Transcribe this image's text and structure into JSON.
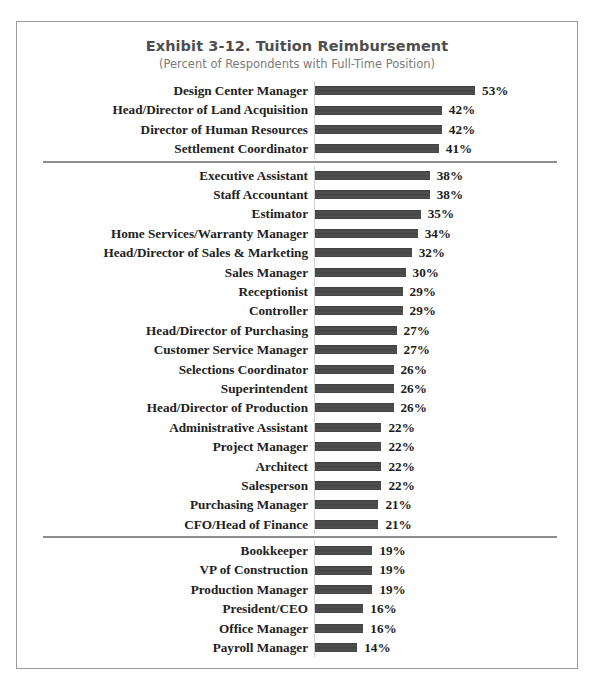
{
  "chart_data": {
    "type": "bar",
    "orientation": "horizontal",
    "title": "Exhibit 3-12.  Tuition Reimbursement",
    "subtitle": "(Percent of Respondents with Full-Time Position)",
    "xlabel": "",
    "ylabel": "",
    "value_suffix": "%",
    "xlim": [
      0,
      53
    ],
    "grid": false,
    "legend": null,
    "bar_color": "#4a4a4a",
    "divider_color": "#8e8e8e",
    "frame_color": "#9a9a9a",
    "title_color": "#4e4e4e",
    "subtitle_color": "#7b7b7b",
    "categories": [
      "Design Center Manager",
      "Head/Director of Land Acquisition",
      "Director of Human Resources",
      "Settlement Coordinator",
      "Executive Assistant",
      "Staff Accountant",
      "Estimator",
      "Home Services/Warranty Manager",
      "Head/Director of Sales & Marketing",
      "Sales Manager",
      "Receptionist",
      "Controller",
      "Head/Director of Purchasing",
      "Customer Service Manager",
      "Selections Coordinator",
      "Superintendent",
      "Head/Director of Production",
      "Administrative Assistant",
      "Project Manager",
      "Architect",
      "Salesperson",
      "Purchasing Manager",
      "CFO/Head of Finance",
      "Bookkeeper",
      "VP of Construction",
      "Production Manager",
      "President/CEO",
      "Office Manager",
      "Payroll Manager"
    ],
    "values": [
      53,
      42,
      42,
      41,
      38,
      38,
      35,
      34,
      32,
      30,
      29,
      29,
      27,
      27,
      26,
      26,
      26,
      22,
      22,
      22,
      22,
      21,
      21,
      19,
      19,
      19,
      16,
      16,
      14
    ],
    "value_labels": [
      "53%",
      "42%",
      "42%",
      "41%",
      "38%",
      "38%",
      "35%",
      "34%",
      "32%",
      "30%",
      "29%",
      "29%",
      "27%",
      "27%",
      "26%",
      "26%",
      "26%",
      "22%",
      "22%",
      "22%",
      "22%",
      "21%",
      "21%",
      "19%",
      "19%",
      "19%",
      "16%",
      "16%",
      "14%"
    ],
    "group_breaks_after": [
      3,
      22
    ]
  }
}
